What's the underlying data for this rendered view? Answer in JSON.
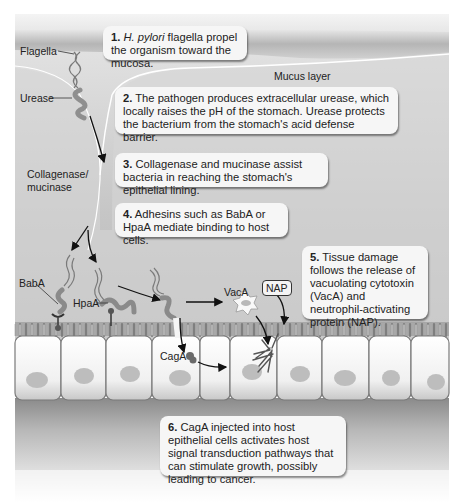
{
  "diagram": {
    "region_label": "Mucus layer",
    "labels": {
      "flagella": "Flagella",
      "urease": "Urease",
      "collagenase": "Collagenase/",
      "mucinase": "mucinase",
      "baba": "BabA",
      "hpaa": "HpaA",
      "vaca": "VacA",
      "nap": "NAP",
      "caga": "CagA"
    },
    "steps": [
      {
        "num": "1.",
        "italic": "H. pylori",
        "text": " flagella propel the organism toward the mucosa."
      },
      {
        "num": "2.",
        "text": " The pathogen produces extracellular urease, which locally raises the pH of the stomach. Urease protects the bacterium from the stomach's acid defense barrier."
      },
      {
        "num": "3.",
        "text": " Collagenase and mucinase assist bacteria in reaching the stomach's epithelial lining."
      },
      {
        "num": "4.",
        "text": " Adhesins such as BabA or HpaA mediate binding to host cells."
      },
      {
        "num": "5.",
        "text": " Tissue damage follows the release of vacuolating cytotoxin (VacA) and neutrophil-activating protein (NAP)."
      },
      {
        "num": "6.",
        "text": " CagA injected into host epithelial cells activates host signal transduction pathways that can stimulate growth, possibly leading to cancer."
      }
    ],
    "colors": {
      "background": "#ffffff",
      "mucus_top": "#bdbdbd",
      "mucus_body": "#d9d9d9",
      "cell": "#f2f2f2",
      "nucleus": "#bcbcbc",
      "callout": "#f6f6f6",
      "arrow": "#111111"
    }
  }
}
